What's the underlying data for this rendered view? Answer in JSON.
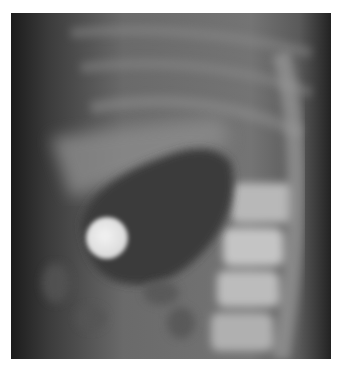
{
  "image": {
    "kind": "lateral abdominal radiograph",
    "description": "Grayscale X-ray showing a round coin-like radiopaque foreign body within a gas-filled stomach, spine visible on the right",
    "colors": {
      "background": "#ffffff",
      "soft_tissue": "#6e6e6e",
      "dark_edge": "#1e1e1e",
      "gas": "#3a3a3a",
      "bone": "#bcbcbc",
      "coin": "#e8e8e8"
    }
  }
}
